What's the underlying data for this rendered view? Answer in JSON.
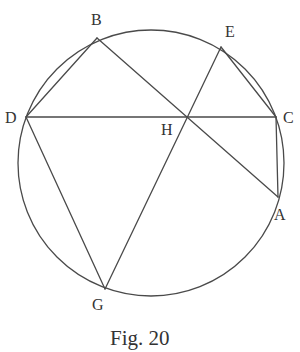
{
  "figure": {
    "caption": "Fig. 20",
    "circle": {
      "cx": 151,
      "cy": 163,
      "r": 133
    },
    "points": {
      "A": {
        "label": "A",
        "x": 278,
        "y": 197,
        "lx": 274,
        "ly": 220
      },
      "B": {
        "label": "B",
        "x": 97,
        "y": 38,
        "lx": 91,
        "ly": 25
      },
      "C": {
        "label": "C",
        "x": 276,
        "y": 117,
        "lx": 283,
        "ly": 123
      },
      "D": {
        "label": "D",
        "x": 26,
        "y": 117,
        "lx": 5,
        "ly": 123
      },
      "E": {
        "label": "E",
        "x": 221,
        "y": 47,
        "lx": 225,
        "ly": 37
      },
      "G": {
        "label": "G",
        "x": 105,
        "y": 289,
        "lx": 92,
        "ly": 310
      },
      "H": {
        "label": "H",
        "x": 187,
        "y": 116,
        "lx": 161,
        "ly": 135
      }
    },
    "segments": [
      [
        "D",
        "B"
      ],
      [
        "B",
        "A"
      ],
      [
        "D",
        "C"
      ],
      [
        "E",
        "C"
      ],
      [
        "C",
        "A"
      ],
      [
        "E",
        "G"
      ],
      [
        "D",
        "G"
      ]
    ],
    "colors": {
      "line": "#4a4a4a",
      "text": "#333333",
      "background": "#ffffff"
    }
  }
}
